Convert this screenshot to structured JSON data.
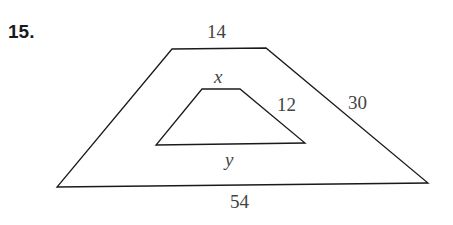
{
  "problem_number": "15.",
  "outer_trapezoid": {
    "top_base": "14",
    "right_leg": "30",
    "bottom_base": "54",
    "points": "172,49 266,48 428,183 57,187"
  },
  "inner_trapezoid": {
    "top_base": "x",
    "right_leg": "12",
    "bottom_base": "y",
    "points": "202,89 240,89 305,143 156,145"
  },
  "colors": {
    "stroke": "#1a1a1a",
    "label": "#444444"
  }
}
